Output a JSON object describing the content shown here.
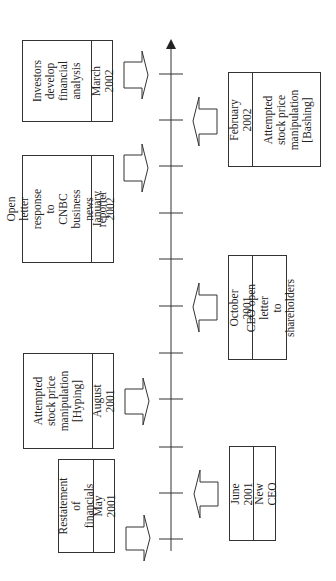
{
  "diagram": {
    "type": "timeline",
    "orientation": "rotated -90deg (time runs bottom to top)",
    "axis": {
      "arrow": "up",
      "tick_count": 11
    },
    "events_above_axis": [
      {
        "date": "May 2001",
        "text": "Restatement of\nfinancials"
      },
      {
        "date": "August 2001",
        "text": "Attempted\nstock price\nmanipulation\n[Hyping]"
      },
      {
        "date": "January 2002",
        "text": "Open letter\nresponse to\nCNBC business\nnews reporter"
      },
      {
        "date": "March 2002",
        "text": "Investors\ndevelop\nfinancial\nanalysis"
      }
    ],
    "events_below_axis": [
      {
        "date": "June 2001",
        "text": "New CEO"
      },
      {
        "date": "October 2001",
        "text": "CEO open letter\nto shareholders"
      },
      {
        "date": "February 2002",
        "text": "Attempted\nstock price\nmanipulation\n[Bashing]"
      }
    ]
  },
  "colors": {
    "line": "#333333",
    "background": "#ffffff"
  }
}
